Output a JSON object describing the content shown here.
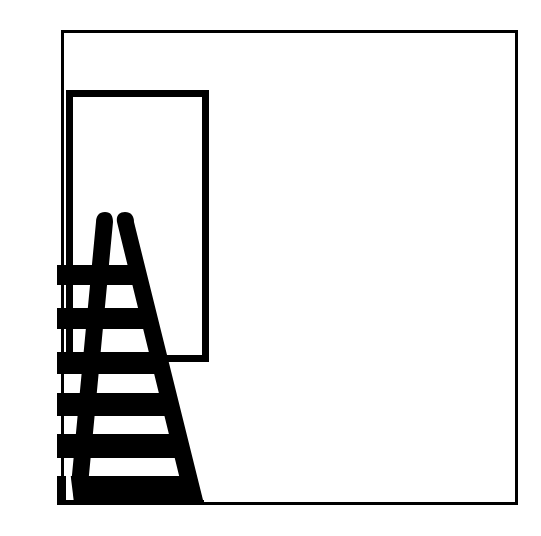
{
  "figure": {
    "panel_label": "B",
    "background_color": "#ffffff",
    "ink_color": "#000000",
    "caption_present": false
  },
  "scene": {
    "name": "stepladder-in-front-of-doorway",
    "description": "Black silhouette line drawing of an open stepladder standing in front of a tall doorway opening, enclosed by a thin rectangular panel frame",
    "objects": [
      {
        "name": "panel-frame",
        "kind": "rectangle-outline",
        "stroke_color": "#000000",
        "stroke_width": 3,
        "x": 61,
        "y": 30,
        "width": 457,
        "height": 475
      },
      {
        "name": "doorway-opening",
        "kind": "rectangle-outline",
        "stroke_color": "#000000",
        "stroke_width": 7,
        "x": 66,
        "y": 90,
        "width": 143,
        "height": 272
      },
      {
        "name": "stepladder",
        "kind": "silhouette",
        "fill_color": "#000000",
        "rail_count": 2,
        "rung_count": 6,
        "apex_y": 212,
        "base_y": 505,
        "left_rail": {
          "top_x": 105,
          "bottom_x": 70,
          "width": 17
        },
        "right_rail": {
          "top_x": 125,
          "bottom_x": 186,
          "width": 18
        },
        "rungs": [
          {
            "index": 1,
            "left_x": 57,
            "right_x": 135,
            "top_y": 265,
            "bottom_y": 285
          },
          {
            "index": 2,
            "left_x": 57,
            "right_x": 148,
            "top_y": 308,
            "bottom_y": 329
          },
          {
            "index": 3,
            "left_x": 57,
            "right_x": 160,
            "top_y": 352,
            "bottom_y": 374
          },
          {
            "index": 4,
            "left_x": 57,
            "right_x": 172,
            "top_y": 393,
            "bottom_y": 416
          },
          {
            "index": 5,
            "left_x": 57,
            "right_x": 184,
            "top_y": 434,
            "bottom_y": 458
          },
          {
            "index": 6,
            "left_x": 57,
            "right_x": 196,
            "top_y": 476,
            "bottom_y": 500
          }
        ]
      }
    ]
  }
}
